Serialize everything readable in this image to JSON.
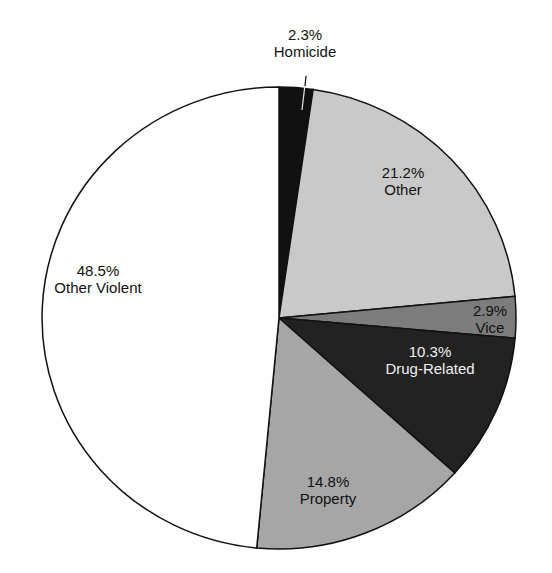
{
  "chart_data": {
    "type": "pie",
    "title": "",
    "start_angle_deg": 0,
    "direction": "clockwise",
    "slices": [
      {
        "label": "Homicide",
        "value": 2.3,
        "pct_label": "2.3%",
        "color": "#111111",
        "text_color": "#111111",
        "lx": 305,
        "ly": 40,
        "leader": true
      },
      {
        "label": "Other",
        "value": 21.2,
        "pct_label": "21.2%",
        "color": "#c9c9c9",
        "text_color": "#111111",
        "lx": 403,
        "ly": 178
      },
      {
        "label": "Vice",
        "value": 2.9,
        "pct_label": "2.9%",
        "color": "#7c7c7c",
        "text_color": "#111111",
        "lx": 490,
        "ly": 316
      },
      {
        "label": "Drug-Related",
        "value": 10.3,
        "pct_label": "10.3%",
        "color": "#222222",
        "text_color": "#f0f0f0",
        "lx": 430,
        "ly": 357
      },
      {
        "label": "Property",
        "value": 14.8,
        "pct_label": "14.8%",
        "color": "#a6a6a6",
        "text_color": "#111111",
        "lx": 328,
        "ly": 487
      },
      {
        "label": "Other Violent",
        "value": 48.5,
        "pct_label": "48.5%",
        "color": "#ffffff",
        "text_color": "#111111",
        "lx": 98,
        "ly": 276
      }
    ],
    "geometry": {
      "cx": 279,
      "cy": 318,
      "rx": 237,
      "ry": 231
    }
  }
}
